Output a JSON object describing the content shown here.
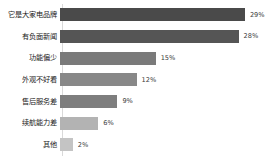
{
  "chart_data": {
    "type": "bar",
    "orientation": "horizontal",
    "title": "",
    "subtitle": "",
    "xlabel": "",
    "ylabel": "",
    "grid": false,
    "legend": false,
    "xlim": [
      0,
      32
    ],
    "value_suffix": "%",
    "categories": [
      "它是大家电品牌",
      "有负面新闻",
      "功能偏少",
      "外观不好看",
      "售后服务差",
      "续航能力差",
      "其他"
    ],
    "values": [
      29,
      28,
      15,
      12,
      9,
      6,
      2
    ],
    "value_labels": [
      "29%",
      "28%",
      "15%",
      "12%",
      "9%",
      "6%",
      "2%"
    ],
    "bar_colors": [
      "#4a4a4a",
      "#555555",
      "#7a7a7a",
      "#888888",
      "#7e7e7e",
      "#b3b3b3",
      "#c4c4c4"
    ]
  },
  "style": {
    "background": "#ffffff",
    "axis_color": "#d9d9d9",
    "label_color": "#1a1a1a",
    "value_color": "#3d3d3d"
  }
}
